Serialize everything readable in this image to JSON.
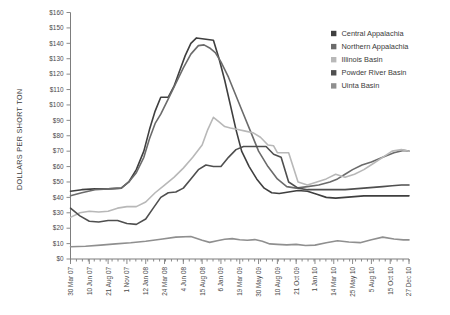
{
  "chart_data": {
    "type": "line",
    "title": "",
    "xlabel": "",
    "ylabel": "DOLLARS PER SHORT TON",
    "ylim": [
      0,
      160
    ],
    "ytick_step": 10,
    "grid": false,
    "legend_position": "top-right",
    "ytick_labels": [
      "$0",
      "$10",
      "$20",
      "$30",
      "$40",
      "$50",
      "$60",
      "$70",
      "$80",
      "$90",
      "$100",
      "$110",
      "$120",
      "$130",
      "$140",
      "$150",
      "$160"
    ],
    "categories": [
      "30 Mar 07",
      "10 Jun 07",
      "21 Aug 07",
      "1 Nov 07",
      "12 Jan 08",
      "24 Mar 08",
      "4 Jun 08",
      "15 Aug 08",
      "6 Jan 09",
      "19 Mar 09",
      "30 May 09",
      "10 Aug 09",
      "21 Oct 09",
      "1 Jan 10",
      "14 Mar 10",
      "25 May 10",
      "5 Aug 10",
      "15 Oct 10",
      "27 Dec 10"
    ],
    "x_minor_count": 57,
    "series": [
      {
        "name": "Central Appalachia",
        "color": "#3f3f3f",
        "x": [
          0,
          0.6,
          1.3,
          2.0,
          2.7,
          3.1,
          3.5,
          3.9,
          4.2,
          4.5,
          4.8,
          5.0,
          5.2,
          5.5,
          5.8,
          6.1,
          6.4,
          6.7,
          7.0,
          7.3,
          7.6,
          7.9,
          8.2,
          8.5,
          8.8,
          9.1,
          9.5,
          9.9,
          10.3,
          10.7,
          11.1,
          11.6,
          12.1,
          12.6,
          13.1,
          13.6,
          14.1,
          14.6,
          15.1,
          15.6,
          16.1,
          16.6,
          17.1,
          17.6,
          18.0
        ],
        "y": [
          44,
          45,
          45.5,
          45.5,
          46,
          50,
          58,
          70,
          84,
          96,
          105,
          105,
          105,
          112,
          122,
          132,
          140,
          143.5,
          143,
          142.5,
          142,
          130,
          116,
          100,
          84,
          70,
          60,
          52,
          46,
          43,
          42.5,
          43.5,
          44.5,
          44,
          42,
          40,
          39.5,
          40,
          40.5,
          41,
          41,
          41,
          41,
          41,
          41
        ]
      },
      {
        "name": "Northern Appalachia",
        "color": "#6b6b6b",
        "x": [
          0,
          0.6,
          1.3,
          2.0,
          2.7,
          3.1,
          3.5,
          3.9,
          4.2,
          4.5,
          4.8,
          5.2,
          5.6,
          6.0,
          6.4,
          6.8,
          7.1,
          7.4,
          7.7,
          8.0,
          8.4,
          8.8,
          9.2,
          9.6,
          10.0,
          10.5,
          11.0,
          11.5,
          12.0,
          12.6,
          13.2,
          13.8,
          14.2,
          14.6,
          15.0,
          15.5,
          16.0,
          16.6,
          17.2,
          17.7,
          18.0
        ],
        "y": [
          41,
          43,
          45,
          45.5,
          46,
          50,
          56,
          66,
          78,
          88,
          94,
          104,
          114,
          124,
          133,
          138.5,
          139,
          137,
          134,
          128,
          118,
          106,
          94,
          82,
          70,
          60,
          52,
          47,
          46,
          47,
          48,
          50,
          52,
          55,
          58,
          61,
          63,
          66,
          69,
          70.5,
          70
        ]
      },
      {
        "name": "Illinois Basin",
        "color": "#b8b8b8",
        "x": [
          0,
          0.5,
          1.0,
          1.5,
          2.0,
          2.5,
          3.0,
          3.5,
          4.0,
          4.5,
          5.0,
          5.5,
          6.0,
          6.5,
          7.0,
          7.3,
          7.6,
          7.9,
          8.2,
          8.5,
          8.9,
          9.3,
          9.7,
          10.1,
          10.5,
          10.8,
          11.0,
          11.2,
          11.6,
          12.1,
          12.6,
          13.1,
          13.6,
          14.1,
          14.6,
          15.1,
          15.6,
          16.1,
          16.6,
          17.1,
          17.6,
          18.0
        ],
        "y": [
          27,
          30,
          31,
          30.5,
          31,
          33,
          34,
          34,
          37,
          43,
          48,
          53,
          59,
          66,
          74,
          84,
          92,
          89,
          86,
          85,
          84,
          83,
          82,
          79,
          74,
          73.5,
          69,
          69,
          69,
          50,
          48,
          50,
          52,
          55,
          53,
          55,
          58,
          62,
          66,
          70,
          71,
          70
        ]
      },
      {
        "name": "Powder River Basin",
        "color": "#4f4f4f",
        "x": [
          0,
          0.5,
          1.0,
          1.5,
          2.0,
          2.5,
          3.0,
          3.5,
          4.0,
          4.4,
          4.8,
          5.2,
          5.6,
          6.0,
          6.4,
          6.8,
          7.2,
          7.6,
          8.0,
          8.4,
          8.8,
          9.2,
          9.6,
          10.0,
          10.4,
          10.8,
          11.2,
          11.6,
          12.1,
          12.6,
          13.1,
          13.6,
          14.1,
          14.6,
          15.1,
          15.6,
          16.1,
          16.6,
          17.1,
          17.6,
          18.0
        ],
        "y": [
          33,
          28,
          24.5,
          24,
          25,
          25,
          23,
          22.5,
          26,
          33,
          40,
          43,
          43.5,
          46,
          52,
          58,
          61,
          60,
          60,
          66,
          71,
          73,
          73,
          73,
          73,
          68,
          66,
          50,
          46,
          45,
          45,
          45,
          45,
          45,
          45.5,
          46,
          46.5,
          47,
          47.5,
          48,
          48
        ]
      },
      {
        "name": "Uinta Basin",
        "color": "#8f8f8f",
        "x": [
          0,
          0.8,
          1.6,
          2.4,
          3.2,
          4.0,
          4.8,
          5.6,
          6.4,
          7.0,
          7.4,
          7.8,
          8.2,
          8.6,
          9.0,
          9.4,
          9.8,
          10.2,
          10.6,
          11.0,
          11.5,
          12.0,
          12.5,
          13.0,
          13.6,
          14.2,
          14.8,
          15.4,
          16.0,
          16.6,
          17.2,
          17.7,
          18.0
        ],
        "y": [
          8,
          8.3,
          9,
          9.8,
          10.5,
          11.5,
          12.8,
          14.2,
          14.6,
          12.2,
          10.8,
          11.8,
          12.8,
          13.2,
          12.5,
          12.2,
          12.6,
          11.5,
          9.8,
          9.5,
          9.2,
          9.5,
          8.8,
          9.0,
          10.5,
          11.8,
          11.0,
          10.6,
          12.5,
          14.2,
          13.0,
          12.4,
          12.4
        ]
      }
    ]
  },
  "legend": {
    "items": [
      {
        "label": "Central Appalachia",
        "color": "#3f3f3f"
      },
      {
        "label": "Northern Appalachia",
        "color": "#6b6b6b"
      },
      {
        "label": "Illinois Basin",
        "color": "#b8b8b8"
      },
      {
        "label": "Powder River Basin",
        "color": "#4f4f4f"
      },
      {
        "label": "Uinta Basin",
        "color": "#8f8f8f"
      }
    ]
  },
  "axis": {
    "y_title": "DOLLARS PER SHORT TON"
  }
}
